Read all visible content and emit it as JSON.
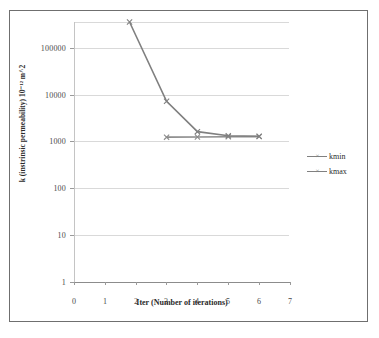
{
  "chart_data": {
    "type": "line",
    "title": "",
    "xlabel": "Iter (Number of iterations)",
    "ylabel": "k (instrinsic permeability) 10^-12 m^2",
    "yscale": "log",
    "xlim": [
      0,
      7
    ],
    "ylim": [
      1,
      300000
    ],
    "grid": true,
    "legend_position": "right",
    "xticks": [
      "0",
      "1",
      "2",
      "3",
      "4",
      "5",
      "6",
      "7"
    ],
    "yticks": [
      "1",
      "10",
      "100",
      "1000",
      "10000",
      "100000"
    ],
    "series": [
      {
        "name": "kmin",
        "color": "#8c8c8c",
        "marker": "x",
        "x": [
          3,
          4,
          5,
          6
        ],
        "values": [
          1150,
          1160,
          1170,
          1180
        ]
      },
      {
        "name": "kmax",
        "color": "#808080",
        "marker": "x",
        "x": [
          1.8,
          3,
          4,
          5,
          6
        ],
        "values": [
          300000,
          6500,
          1500,
          1230,
          1200
        ]
      }
    ]
  },
  "axis": {
    "x_label": "Iter (Number of iterations)",
    "y_label": "k (instrinsic permeability) 10⁻¹² m^2",
    "x_ticks": [
      "0",
      "1",
      "2",
      "3",
      "4",
      "5",
      "6",
      "7"
    ],
    "y_ticks": [
      "100000",
      "10000",
      "1000",
      "100",
      "10",
      "1"
    ]
  },
  "legend": {
    "items": [
      {
        "label": "kmin"
      },
      {
        "label": "kmax"
      }
    ]
  },
  "colors": {
    "series_kmin": "#8c8c8c",
    "series_kmax": "#808080",
    "gridline": "#d9d9d9",
    "frame": "#6f6f6f",
    "text": "#2b2b2b",
    "background": "#ffffff"
  }
}
